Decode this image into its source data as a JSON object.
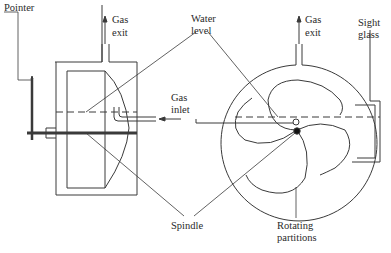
{
  "diagram": {
    "colors": {
      "stroke": "#3a3a3a",
      "background": "#ffffff"
    },
    "labels": {
      "pointer": "Pointer",
      "gas_exit_left_1": "Gas",
      "gas_exit_left_2": "exit",
      "water_level_1": "Water",
      "water_level_2": "level",
      "gas_inlet_1": "Gas",
      "gas_inlet_2": "inlet",
      "gas_exit_right_1": "Gas",
      "gas_exit_right_2": "exit",
      "sight_glass_1": "Sight",
      "sight_glass_2": "glass",
      "spindle": "Spindle",
      "rotating_partitions_1": "Rotating",
      "rotating_partitions_2": "partitions"
    }
  }
}
